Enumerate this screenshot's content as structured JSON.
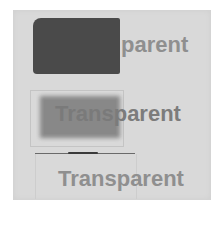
{
  "image": {
    "description": "Photograph of three transparency samples on a light gray card",
    "background_color": "#d9d9d9",
    "samples": [
      {
        "label": "parent",
        "swatch_color": "#4a4a4a",
        "opacity_level": "opaque"
      },
      {
        "label": "Transparent",
        "swatch_color": "#7a7a7a",
        "opacity_level": "semi-transparent"
      },
      {
        "label": "Transparent",
        "swatch_color": "none",
        "opacity_level": "transparent"
      }
    ]
  }
}
